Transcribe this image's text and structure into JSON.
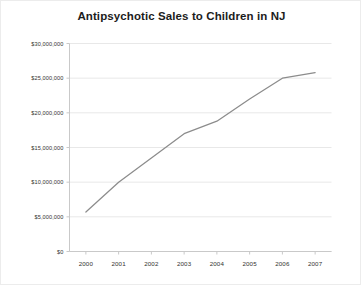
{
  "chart_data": {
    "type": "line",
    "title": "Antipsychotic Sales to Children in NJ",
    "xlabel": "",
    "ylabel": "",
    "categories": [
      "2000",
      "2001",
      "2002",
      "2003",
      "2004",
      "2005",
      "2006",
      "2007"
    ],
    "values": [
      5700000,
      10000000,
      13500000,
      17000000,
      18800000,
      22000000,
      25000000,
      25800000
    ],
    "series": [
      {
        "name": "Antipsychotic Sales",
        "values": [
          5700000,
          10000000,
          13500000,
          17000000,
          18800000,
          22000000,
          25000000,
          25800000
        ],
        "color": "#8c8c8c"
      }
    ],
    "ylim": [
      0,
      30000000
    ],
    "ytick_values": [
      0,
      5000000,
      10000000,
      15000000,
      20000000,
      25000000,
      30000000
    ],
    "ytick_labels": [
      "$0",
      "$5,000,000",
      "$10,000,000",
      "$15,000,000",
      "$20,000,000",
      "$25,000,000",
      "$30,000,000"
    ],
    "xtick_labels": [
      "2000",
      "2001",
      "2002",
      "2003",
      "2004",
      "2005",
      "2006",
      "2007"
    ],
    "grid": true,
    "grid_axis": "y",
    "grid_color": "#e8e8e8",
    "legend": false,
    "legend_position": "none",
    "plot_background": "#ffffff",
    "axis_color": "#c9c9c9"
  }
}
